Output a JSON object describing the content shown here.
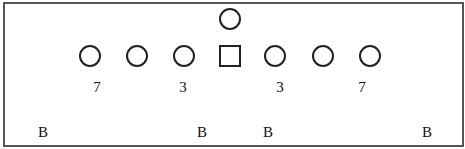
{
  "diagram": {
    "type": "football-formation",
    "colors": {
      "line": "#222222",
      "border": "#555555",
      "background": "#ffffff",
      "text": "#111111"
    },
    "backfield": {
      "shape": "circle",
      "label": "",
      "x": 230,
      "y": 19
    },
    "line": [
      {
        "shape": "circle",
        "x": 90,
        "y": 56
      },
      {
        "shape": "circle",
        "x": 137,
        "y": 56
      },
      {
        "shape": "circle",
        "x": 184,
        "y": 56
      },
      {
        "shape": "square",
        "x": 230,
        "y": 56,
        "role": "center"
      },
      {
        "shape": "circle",
        "x": 275,
        "y": 56
      },
      {
        "shape": "circle",
        "x": 323,
        "y": 56
      },
      {
        "shape": "circle",
        "x": 370,
        "y": 56
      }
    ],
    "gap_labels": [
      {
        "text": "7",
        "x": 97,
        "y": 87
      },
      {
        "text": "3",
        "x": 183,
        "y": 87
      },
      {
        "text": "3",
        "x": 280,
        "y": 87
      },
      {
        "text": "7",
        "x": 362,
        "y": 87
      }
    ],
    "b_labels": [
      {
        "text": "B",
        "x": 43,
        "y": 132
      },
      {
        "text": "B",
        "x": 202,
        "y": 132
      },
      {
        "text": "B",
        "x": 268,
        "y": 132
      },
      {
        "text": "B",
        "x": 427,
        "y": 132
      }
    ]
  }
}
